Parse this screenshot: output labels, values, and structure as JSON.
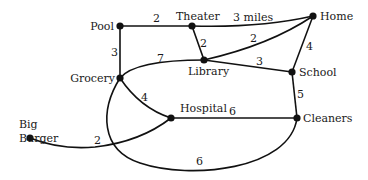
{
  "diagram": {
    "type": "weighted-graph",
    "nodes": [
      {
        "id": "pool",
        "label": "Pool",
        "x": 120,
        "y": 26
      },
      {
        "id": "theater",
        "label": "Theater",
        "x": 192,
        "y": 26
      },
      {
        "id": "home",
        "label": "Home",
        "x": 313,
        "y": 16
      },
      {
        "id": "library",
        "label": "Library",
        "x": 204,
        "y": 60
      },
      {
        "id": "grocery",
        "label": "Grocery",
        "x": 120,
        "y": 78
      },
      {
        "id": "school",
        "label": "School",
        "x": 292,
        "y": 72
      },
      {
        "id": "hospital",
        "label": "Hospital",
        "x": 171,
        "y": 118
      },
      {
        "id": "cleaners",
        "label": "Cleaners",
        "x": 297,
        "y": 118
      },
      {
        "id": "big_burger",
        "label_line1": "Big",
        "label_line2": "Burger",
        "x": 30,
        "y": 138
      }
    ],
    "edges": [
      {
        "from": "pool",
        "to": "theater",
        "weight": "2"
      },
      {
        "from": "theater",
        "to": "home",
        "weight": "3 miles"
      },
      {
        "from": "pool",
        "to": "grocery",
        "weight": "3"
      },
      {
        "from": "theater",
        "to": "library",
        "weight": "2"
      },
      {
        "from": "library",
        "to": "home",
        "weight": "2"
      },
      {
        "from": "grocery",
        "to": "library",
        "weight": "7"
      },
      {
        "from": "library",
        "to": "school",
        "weight": "3"
      },
      {
        "from": "home",
        "to": "school",
        "weight": "4"
      },
      {
        "from": "grocery",
        "to": "hospital",
        "weight": "4"
      },
      {
        "from": "school",
        "to": "cleaners",
        "weight": "5"
      },
      {
        "from": "hospital",
        "to": "cleaners",
        "weight": "6"
      },
      {
        "from": "big_burger",
        "to": "hospital",
        "weight": "2"
      },
      {
        "from": "grocery",
        "to": "cleaners",
        "weight": "6"
      }
    ]
  },
  "labels": {
    "pool": "Pool",
    "theater": "Theater",
    "home": "Home",
    "library": "Library",
    "grocery": "Grocery",
    "school": "School",
    "hospital": "Hospital",
    "cleaners": "Cleaners",
    "big": "Big",
    "burger": "Burger"
  },
  "weights": {
    "pool_theater": "2",
    "theater_home": "3 miles",
    "pool_grocery": "3",
    "theater_library": "2",
    "library_home": "2",
    "grocery_library": "7",
    "library_school": "3",
    "home_school": "4",
    "grocery_hospital": "4",
    "school_cleaners": "5",
    "hospital_cleaners": "6",
    "burger_hospital": "2",
    "grocery_cleaners": "6"
  }
}
